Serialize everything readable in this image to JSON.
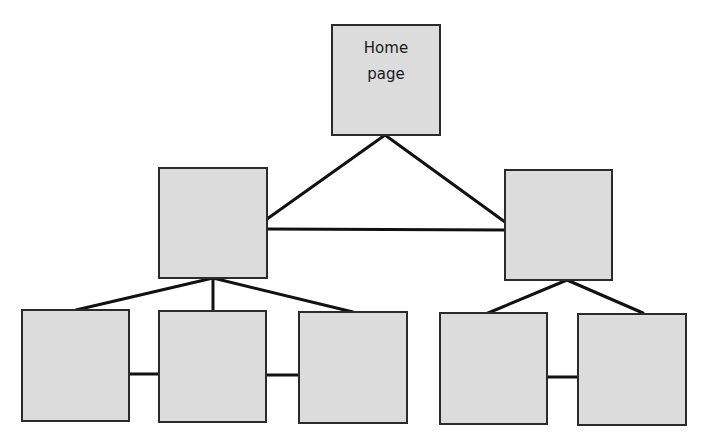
{
  "diagram": {
    "type": "site-hierarchy",
    "colors": {
      "box_fill": "#dcdcdc",
      "box_border": "#2b2b2b",
      "line": "#111111",
      "background": "#ffffff"
    },
    "nodes": [
      {
        "id": "home",
        "label": "Home\npage",
        "level": 0
      },
      {
        "id": "mid-left",
        "label": "",
        "level": 1
      },
      {
        "id": "mid-right",
        "label": "",
        "level": 1
      },
      {
        "id": "leaf-1",
        "label": "",
        "level": 2
      },
      {
        "id": "leaf-2",
        "label": "",
        "level": 2
      },
      {
        "id": "leaf-3",
        "label": "",
        "level": 2
      },
      {
        "id": "leaf-4",
        "label": "",
        "level": 2
      },
      {
        "id": "leaf-5",
        "label": "",
        "level": 2
      }
    ],
    "edges": [
      {
        "from": "home",
        "to": "mid-left"
      },
      {
        "from": "home",
        "to": "mid-right"
      },
      {
        "from": "mid-left",
        "to": "mid-right"
      },
      {
        "from": "mid-left",
        "to": "leaf-1"
      },
      {
        "from": "mid-left",
        "to": "leaf-2"
      },
      {
        "from": "mid-left",
        "to": "leaf-3"
      },
      {
        "from": "leaf-1",
        "to": "leaf-2"
      },
      {
        "from": "leaf-2",
        "to": "leaf-3"
      },
      {
        "from": "mid-right",
        "to": "leaf-4"
      },
      {
        "from": "mid-right",
        "to": "leaf-5"
      },
      {
        "from": "leaf-4",
        "to": "leaf-5"
      }
    ]
  }
}
